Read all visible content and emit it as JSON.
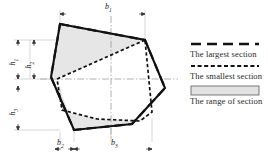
{
  "figure": {
    "type": "technical-cross-section-diagram",
    "background": "#ffffff"
  },
  "dimension_labels": {
    "horizontal": [
      {
        "id": "b1",
        "base": "b",
        "sub": "1",
        "x": 105,
        "y": 3,
        "desc": "overall top width"
      },
      {
        "id": "b2",
        "base": "b",
        "sub": "2",
        "x": 57,
        "y": 139,
        "desc": "lower-left width"
      },
      {
        "id": "b3",
        "base": "b",
        "sub": "3",
        "x": 111,
        "y": 139,
        "desc": "lower-center width"
      }
    ],
    "vertical": [
      {
        "id": "h1",
        "base": "h",
        "sub": "1",
        "x": 11,
        "y": 57,
        "desc": "upper height"
      },
      {
        "id": "h2",
        "base": "h",
        "sub": "2",
        "x": 27,
        "y": 60,
        "desc": "mid height"
      },
      {
        "id": "h3",
        "base": "h",
        "sub": "3",
        "x": 11,
        "y": 107,
        "desc": "lower height"
      }
    ]
  },
  "legend": {
    "items": [
      {
        "key": "largest",
        "label": "The largest section",
        "style": "long-dash",
        "color": "#111111"
      },
      {
        "key": "smallest",
        "label": "The smallest section",
        "style": "short-dash",
        "color": "#111111"
      },
      {
        "key": "range",
        "label": "The range of section",
        "style": "filled-box",
        "color": "#e2e2e2",
        "border": "#5a5a5a"
      }
    ]
  },
  "colors": {
    "line": "#111111",
    "fill_range": "#e6e6e6",
    "centerline": "#9a9a9a",
    "extension": "#b8b8b8",
    "text": "#222222"
  },
  "chart_data": {
    "type": "line",
    "title": "",
    "xlabel": "",
    "ylabel": "",
    "series": [
      {
        "name": "The largest section",
        "style": "long-dash",
        "closed": true,
        "points": [
          [
            60,
            24
          ],
          [
            145,
            40
          ],
          [
            165,
            88
          ],
          [
            132,
            124
          ],
          [
            74,
            130
          ],
          [
            51,
            77
          ]
        ]
      },
      {
        "name": "The smallest section",
        "style": "short-dash",
        "closed": true,
        "points": [
          [
            145,
            40
          ],
          [
            57,
            79
          ],
          [
            62,
            110
          ],
          [
            97,
            119
          ],
          [
            140,
            121
          ],
          [
            152,
            112
          ]
        ]
      },
      {
        "name": "Solid outline",
        "style": "solid",
        "closed": false,
        "points": [
          [
            60,
            24
          ],
          [
            145,
            40
          ],
          [
            165,
            88
          ],
          [
            132,
            124
          ],
          [
            74,
            130
          ],
          [
            51,
            77
          ],
          [
            60,
            24
          ]
        ]
      }
    ],
    "shaded_regions": [
      {
        "name": "upper range",
        "points": [
          [
            60,
            24
          ],
          [
            145,
            40
          ],
          [
            57,
            79
          ],
          [
            51,
            77
          ]
        ]
      },
      {
        "name": "lower range",
        "points": [
          [
            57,
            79
          ],
          [
            62,
            110
          ],
          [
            97,
            119
          ],
          [
            140,
            121
          ],
          [
            152,
            112
          ],
          [
            132,
            124
          ],
          [
            74,
            130
          ]
        ]
      }
    ],
    "centerlines": {
      "vertical_x": 111,
      "horizontal_y": 79
    }
  }
}
